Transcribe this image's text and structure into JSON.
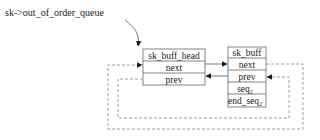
{
  "diagram": {
    "title": "sk->out_of_order_queue",
    "head_box": {
      "rows": [
        "sk_buff_head",
        "next",
        "prev"
      ]
    },
    "buff_box": {
      "rows": [
        "sk_buff",
        "next",
        "prev",
        "seq",
        "end_seq"
      ],
      "subscripts": {
        "seq": "2",
        "end_seq": "2"
      }
    },
    "colors": {
      "line": "#555555",
      "box_border": "#666666",
      "text": "#222222",
      "arrow": "#1a1a1a",
      "dash": "#888888"
    }
  }
}
